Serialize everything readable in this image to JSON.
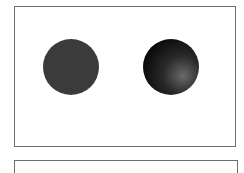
{
  "figure": {
    "panels": [
      {
        "name": "top-panel",
        "shapes": [
          {
            "name": "flat-circle",
            "shading": "flat",
            "fill": "#3b3b3b"
          },
          {
            "name": "shaded-sphere",
            "shading": "radial-gradient",
            "highlight": "#6a6a6a",
            "midtone": "#2a2a2a",
            "shadow": "#050505"
          }
        ]
      },
      {
        "name": "bottom-panel",
        "shapes": []
      }
    ],
    "colors": {
      "frame": "#6e6e6e",
      "background": "#ffffff"
    }
  }
}
